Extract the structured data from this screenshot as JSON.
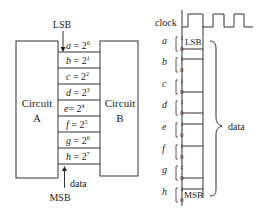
{
  "left": {
    "circuit_a": {
      "line1": "Circuit",
      "line2": "A"
    },
    "circuit_b": {
      "line1": "Circuit",
      "line2": "B"
    },
    "lsb_label": "LSB",
    "msb_label": "MSB",
    "data_label": "data",
    "register": [
      {
        "var": "a",
        "exp": "0"
      },
      {
        "var": "b",
        "exp": "1"
      },
      {
        "var": "c",
        "exp": "2"
      },
      {
        "var": "d",
        "exp": "3"
      },
      {
        "var": "e",
        "exp": "4"
      },
      {
        "var": "f",
        "exp": "5"
      },
      {
        "var": "g",
        "exp": "6"
      },
      {
        "var": "h",
        "exp": "7"
      }
    ]
  },
  "right": {
    "clock_label": "clock",
    "lsb_label": "LSB",
    "msb_label": "MSB",
    "data_label": "data",
    "high": "1",
    "low": "0",
    "signals": [
      "a",
      "b",
      "c",
      "d",
      "e",
      "f",
      "g",
      "h"
    ],
    "levels": [
      0,
      1,
      0,
      1,
      0,
      1,
      0,
      1
    ]
  }
}
